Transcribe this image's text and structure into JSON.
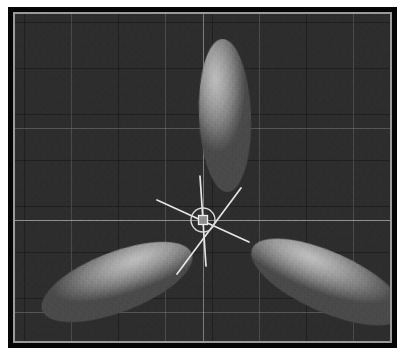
{
  "app": {
    "type": "3d-viewport-screenshot",
    "title": "3D Viewport"
  },
  "viewport": {
    "name": "perspective-viewport",
    "background_color": "#2d2d2d",
    "frame_color": "#050505",
    "bevel_color": "#9a9a9a",
    "grid": {
      "visible": true,
      "minor_color": "#232323",
      "major_color": "#b4b4b4",
      "minor_spacing_px": 47,
      "major_vertical_x": [
        56,
        150,
        244,
        338
      ],
      "major_horizontal_y": [
        114,
        206,
        298
      ]
    },
    "axes": {
      "x_axis_color": "#cdcdcd",
      "y_axis_color": "#c8c8c8",
      "origin_x": 188,
      "origin_y": 206
    }
  },
  "objects": [
    {
      "name": "ellipsoid-top",
      "label": "Ellipsoid 1",
      "shape": "ellipsoid",
      "orientation_deg": -2,
      "highlight_color": "#bdbdbd",
      "shadow_color": "#4a4a4a",
      "center_x": 210,
      "center_y": 102,
      "length_px": 153,
      "width_px": 52
    },
    {
      "name": "ellipsoid-bottom-left",
      "label": "Ellipsoid 2",
      "shape": "ellipsoid",
      "orientation_deg": -21,
      "highlight_color": "#bebebe",
      "shadow_color": "#4a4a4a",
      "center_x": 102,
      "center_y": 268,
      "length_px": 160,
      "width_px": 60
    },
    {
      "name": "ellipsoid-bottom-right",
      "label": "Ellipsoid 3",
      "shape": "ellipsoid",
      "orientation_deg": 24,
      "highlight_color": "#c0c0c0",
      "shadow_color": "#4a4a4a",
      "center_x": 313,
      "center_y": 268,
      "length_px": 165,
      "width_px": 60
    }
  ],
  "gizmo": {
    "name": "transform-manipulator",
    "style": "trackball-rotate",
    "color": "#e8e8e8",
    "center_x": 188,
    "center_y": 206,
    "ring_radius_px": 12,
    "handle_size_px": 9,
    "axes": [
      {
        "name": "axis-handle-a",
        "angle_deg": -42,
        "length_px": 62
      },
      {
        "name": "axis-handle-b",
        "angle_deg": 28,
        "length_px": 60
      },
      {
        "name": "axis-handle-c",
        "angle_deg": 80,
        "length_px": 52
      }
    ]
  }
}
